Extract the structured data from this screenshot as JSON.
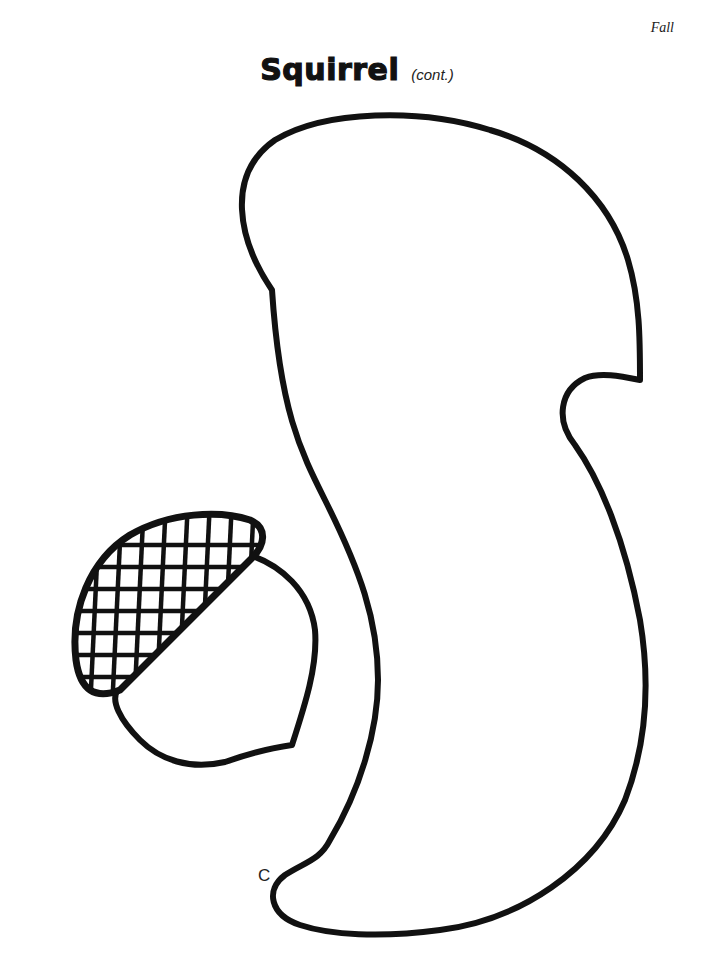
{
  "header": {
    "section_label": "Fall",
    "title": "Squirrel",
    "subtitle": "(cont.)"
  },
  "drawing": {
    "pattern_piece_label": "C",
    "shapes": [
      "squirrel-tail-outline",
      "acorn"
    ],
    "stroke_color": "#111111",
    "fill_color": "#ffffff"
  }
}
